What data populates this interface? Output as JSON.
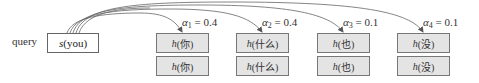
{
  "query": {
    "label": "query",
    "box": {
      "fn": "s",
      "arg": "(you)"
    }
  },
  "keys": [
    {
      "fn": "h",
      "arg": "(你)",
      "alpha_symbol": "α",
      "alpha_index": "1",
      "alpha_eq": " = 0.4"
    },
    {
      "fn": "h",
      "arg": "(什么)",
      "alpha_symbol": "α",
      "alpha_index": "2",
      "alpha_eq": " = 0.4"
    },
    {
      "fn": "h",
      "arg": "(也)",
      "alpha_symbol": "α",
      "alpha_index": "3",
      "alpha_eq": " = 0.1"
    },
    {
      "fn": "h",
      "arg": "(没)",
      "alpha_symbol": "α",
      "alpha_index": "4",
      "alpha_eq": " = 0.1"
    }
  ],
  "values": [
    {
      "fn": "h",
      "arg": "(你)"
    },
    {
      "fn": "h",
      "arg": "(什么)"
    },
    {
      "fn": "h",
      "arg": "(也)"
    },
    {
      "fn": "h",
      "arg": "(没)"
    }
  ],
  "colors": {
    "box_fill": "#e4e4e4",
    "box_border": "#777777",
    "curve": "#555555"
  }
}
